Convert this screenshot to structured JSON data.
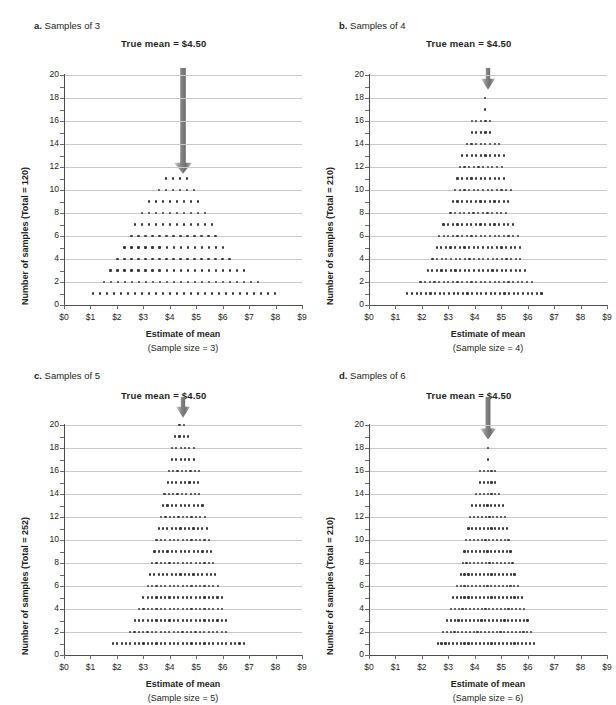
{
  "figure": {
    "background": "#ffffff",
    "dot_color": "#3a3a3a",
    "grid_color": "#c9c9c9",
    "axis_color": "#4d4d4d",
    "arrow_color": "#7f7f7f"
  },
  "common": {
    "true_mean_label": "True mean  =  $4.50",
    "x_title": "Estimate of mean",
    "x_ticks": [
      "$0",
      "$1",
      "$2",
      "$3",
      "$4",
      "$5",
      "$6",
      "$7",
      "$8",
      "$9"
    ],
    "x_tick_values": [
      0,
      1,
      2,
      3,
      4,
      5,
      6,
      7,
      8,
      9
    ],
    "y_ticks": [
      "0",
      "2",
      "4",
      "6",
      "8",
      "10",
      "12",
      "14",
      "16",
      "18",
      "20"
    ],
    "y_tick_values": [
      0,
      2,
      4,
      6,
      8,
      10,
      12,
      14,
      16,
      18,
      20
    ],
    "true_mean_value": 4.5
  },
  "panels": [
    {
      "id": "a",
      "letter": "a.",
      "title": "Samples of 3",
      "y_title": "Number of samples (Total = 120)",
      "x_sub": "(Sample size = 3)",
      "total": 120,
      "sample_size": 3,
      "arrow_top_value": 20.6,
      "arrow_tip_value": 11.4,
      "arrow_width": 9
    },
    {
      "id": "b",
      "letter": "b.",
      "title": "Samples of 4",
      "y_title": "Number of samples (Total = 210)",
      "x_sub": "(Sample size = 4)",
      "total": 210,
      "sample_size": 4,
      "arrow_top_value": 20.6,
      "arrow_tip_value": 18.7,
      "arrow_width": 7
    },
    {
      "id": "c",
      "letter": "c.",
      "title": "Samples of 5",
      "y_title": "Number of samples (Total = 252)",
      "x_sub": "(Sample size = 5)",
      "total": 252,
      "sample_size": 5,
      "arrow_top_value": 22.4,
      "arrow_tip_value": 20.6,
      "arrow_width": 7
    },
    {
      "id": "d",
      "letter": "d.",
      "title": "Samples of 6",
      "y_title": "Number of samples (Total = 210)",
      "x_sub": "(Sample size = 6)",
      "total": 210,
      "sample_size": 6,
      "arrow_top_value": 22.4,
      "arrow_tip_value": 18.7,
      "arrow_width": 8
    }
  ],
  "chart_data": [
    {
      "type": "scatter",
      "panel": "a",
      "title": "a. Samples of 3",
      "subtitle": "True mean  =  $4.50",
      "xlabel": "Estimate of mean (Sample size = 3)",
      "ylabel": "Number of samples (Total = 120)",
      "xlim": [
        0,
        9
      ],
      "ylim": [
        0,
        20
      ],
      "grid": true,
      "annotation": "True mean  =  $4.50",
      "description": "Sampling distribution dot plot; each dot is one sample. Rows are stacked counts at each mean value.",
      "rows": [
        {
          "y": 1,
          "x_start": 1.1,
          "x_step": 0.265,
          "count": 27
        },
        {
          "y": 2,
          "x_start": 1.5,
          "x_step": 0.265,
          "count": 23
        },
        {
          "y": 3,
          "x_start": 1.76,
          "x_step": 0.265,
          "count": 20
        },
        {
          "y": 4,
          "x_start": 2.02,
          "x_step": 0.265,
          "count": 17
        },
        {
          "y": 5,
          "x_start": 2.29,
          "x_step": 0.265,
          "count": 15
        },
        {
          "y": 6,
          "x_start": 2.55,
          "x_step": 0.265,
          "count": 13
        },
        {
          "y": 7,
          "x_start": 2.68,
          "x_step": 0.265,
          "count": 12
        },
        {
          "y": 8,
          "x_start": 2.94,
          "x_step": 0.265,
          "count": 10
        },
        {
          "y": 9,
          "x_start": 3.21,
          "x_step": 0.265,
          "count": 8
        },
        {
          "y": 10,
          "x_start": 3.6,
          "x_step": 0.265,
          "count": 6
        },
        {
          "y": 11,
          "x_start": 3.87,
          "x_step": 0.265,
          "count": 4
        }
      ]
    },
    {
      "type": "scatter",
      "panel": "b",
      "title": "b. Samples of 4",
      "subtitle": "True mean  =  $4.50",
      "xlabel": "Estimate of mean (Sample size = 4)",
      "ylabel": "Number of samples (Total = 210)",
      "xlim": [
        0,
        9
      ],
      "ylim": [
        0,
        20
      ],
      "grid": true,
      "annotation": "True mean  =  $4.50",
      "rows": [
        {
          "y": 1,
          "x_start": 1.45,
          "x_step": 0.175,
          "count": 30
        },
        {
          "y": 2,
          "x_start": 1.95,
          "x_step": 0.175,
          "count": 25
        },
        {
          "y": 3,
          "x_start": 2.22,
          "x_step": 0.175,
          "count": 22
        },
        {
          "y": 4,
          "x_start": 2.4,
          "x_step": 0.175,
          "count": 20
        },
        {
          "y": 5,
          "x_start": 2.56,
          "x_step": 0.175,
          "count": 19
        },
        {
          "y": 6,
          "x_start": 2.65,
          "x_step": 0.175,
          "count": 18
        },
        {
          "y": 7,
          "x_start": 2.82,
          "x_step": 0.175,
          "count": 16
        },
        {
          "y": 8,
          "x_start": 3.08,
          "x_step": 0.175,
          "count": 13
        },
        {
          "y": 9,
          "x_start": 3.17,
          "x_step": 0.175,
          "count": 13
        },
        {
          "y": 10,
          "x_start": 3.26,
          "x_step": 0.175,
          "count": 13
        },
        {
          "y": 11,
          "x_start": 3.35,
          "x_step": 0.175,
          "count": 11
        },
        {
          "y": 12,
          "x_start": 3.44,
          "x_step": 0.175,
          "count": 10
        },
        {
          "y": 13,
          "x_start": 3.53,
          "x_step": 0.175,
          "count": 10
        },
        {
          "y": 14,
          "x_start": 3.7,
          "x_step": 0.175,
          "count": 8
        },
        {
          "y": 15,
          "x_start": 3.88,
          "x_step": 0.175,
          "count": 5
        },
        {
          "y": 16,
          "x_start": 3.88,
          "x_step": 0.175,
          "count": 5
        },
        {
          "y": 17,
          "x_start": 4.4,
          "x_step": 0.175,
          "count": 1
        },
        {
          "y": 18,
          "x_start": 4.4,
          "x_step": 0.175,
          "count": 1
        }
      ]
    },
    {
      "type": "scatter",
      "panel": "c",
      "title": "c. Samples of 5",
      "subtitle": "True mean  =  $4.50",
      "xlabel": "Estimate of mean (Sample size = 5)",
      "ylabel": "Number of samples (Total = 252)",
      "xlim": [
        0,
        9
      ],
      "ylim": [
        0,
        20
      ],
      "grid": true,
      "annotation": "True mean  =  $4.50",
      "rows": [
        {
          "y": 1,
          "x_start": 1.85,
          "x_step": 0.165,
          "count": 31
        },
        {
          "y": 2,
          "x_start": 2.5,
          "x_step": 0.165,
          "count": 23
        },
        {
          "y": 3,
          "x_start": 2.67,
          "x_step": 0.165,
          "count": 22
        },
        {
          "y": 4,
          "x_start": 2.84,
          "x_step": 0.165,
          "count": 20
        },
        {
          "y": 5,
          "x_start": 3.0,
          "x_step": 0.165,
          "count": 19
        },
        {
          "y": 6,
          "x_start": 3.17,
          "x_step": 0.165,
          "count": 17
        },
        {
          "y": 7,
          "x_start": 3.25,
          "x_step": 0.165,
          "count": 16
        },
        {
          "y": 8,
          "x_start": 3.33,
          "x_step": 0.165,
          "count": 15
        },
        {
          "y": 9,
          "x_start": 3.42,
          "x_step": 0.165,
          "count": 14
        },
        {
          "y": 10,
          "x_start": 3.5,
          "x_step": 0.165,
          "count": 13
        },
        {
          "y": 11,
          "x_start": 3.58,
          "x_step": 0.165,
          "count": 12
        },
        {
          "y": 12,
          "x_start": 3.67,
          "x_step": 0.165,
          "count": 11
        },
        {
          "y": 13,
          "x_start": 3.75,
          "x_step": 0.165,
          "count": 10
        },
        {
          "y": 14,
          "x_start": 3.8,
          "x_step": 0.165,
          "count": 9
        },
        {
          "y": 15,
          "x_start": 3.92,
          "x_step": 0.165,
          "count": 8
        },
        {
          "y": 16,
          "x_start": 3.96,
          "x_step": 0.165,
          "count": 8
        },
        {
          "y": 17,
          "x_start": 4.08,
          "x_step": 0.165,
          "count": 6
        },
        {
          "y": 18,
          "x_start": 4.08,
          "x_step": 0.165,
          "count": 6
        },
        {
          "y": 19,
          "x_start": 4.2,
          "x_step": 0.165,
          "count": 4
        },
        {
          "y": 20,
          "x_start": 4.37,
          "x_step": 0.165,
          "count": 2
        }
      ]
    },
    {
      "type": "scatter",
      "panel": "d",
      "title": "d. Samples of 6",
      "subtitle": "True mean  =  $4.50",
      "xlabel": "Estimate of mean (Sample size = 6)",
      "ylabel": "Number of samples (Total = 210)",
      "xlim": [
        0,
        9
      ],
      "ylim": [
        0,
        20
      ],
      "grid": true,
      "annotation": "True mean  =  $4.50",
      "rows": [
        {
          "y": 1,
          "x_start": 2.6,
          "x_step": 0.145,
          "count": 26
        },
        {
          "y": 2,
          "x_start": 2.8,
          "x_step": 0.145,
          "count": 24
        },
        {
          "y": 3,
          "x_start": 2.95,
          "x_step": 0.145,
          "count": 22
        },
        {
          "y": 4,
          "x_start": 3.1,
          "x_step": 0.145,
          "count": 20
        },
        {
          "y": 5,
          "x_start": 3.18,
          "x_step": 0.145,
          "count": 19
        },
        {
          "y": 6,
          "x_start": 3.32,
          "x_step": 0.145,
          "count": 17
        },
        {
          "y": 7,
          "x_start": 3.47,
          "x_step": 0.145,
          "count": 15
        },
        {
          "y": 8,
          "x_start": 3.54,
          "x_step": 0.145,
          "count": 14
        },
        {
          "y": 9,
          "x_start": 3.61,
          "x_step": 0.145,
          "count": 13
        },
        {
          "y": 10,
          "x_start": 3.68,
          "x_step": 0.145,
          "count": 12
        },
        {
          "y": 11,
          "x_start": 3.76,
          "x_step": 0.145,
          "count": 11
        },
        {
          "y": 12,
          "x_start": 3.83,
          "x_step": 0.145,
          "count": 10
        },
        {
          "y": 13,
          "x_start": 3.9,
          "x_step": 0.145,
          "count": 9
        },
        {
          "y": 14,
          "x_start": 4.05,
          "x_step": 0.145,
          "count": 7
        },
        {
          "y": 15,
          "x_start": 4.2,
          "x_step": 0.145,
          "count": 5
        },
        {
          "y": 16,
          "x_start": 4.2,
          "x_step": 0.145,
          "count": 5
        },
        {
          "y": 17,
          "x_start": 4.5,
          "x_step": 0.145,
          "count": 1
        },
        {
          "y": 18,
          "x_start": 4.5,
          "x_step": 0.145,
          "count": 1
        }
      ]
    }
  ]
}
